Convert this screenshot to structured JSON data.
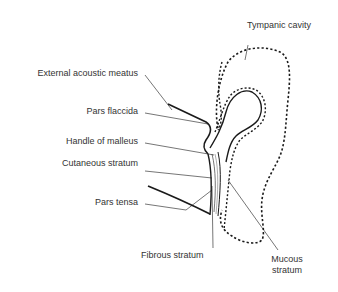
{
  "diagram": {
    "labels": {
      "tympanic_cavity": "Tympanic cavity",
      "external_acoustic_meatus": "External acoustic meatus",
      "pars_flaccida": "Pars flaccida",
      "handle_of_malleus": "Handle of malleus",
      "cutaneous_stratum": "Cutaneous stratum",
      "pars_tensa": "Pars tensa",
      "fibrous_stratum": "Fibrous stratum",
      "mucous_stratum_line1": "Mucous",
      "mucous_stratum_line2": "stratum"
    },
    "colors": {
      "line": "#1a1a1a",
      "text": "#333333",
      "background": "#ffffff"
    }
  }
}
